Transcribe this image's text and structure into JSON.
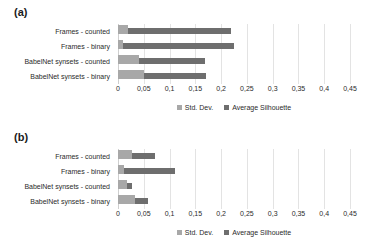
{
  "figure": {
    "panels": [
      {
        "label": "(a)"
      },
      {
        "label": "(b)"
      }
    ]
  },
  "legend": {
    "items": [
      {
        "name": "Std. Dev.",
        "color": "#a8a8a8"
      },
      {
        "name": "Average Silhouette",
        "color": "#6e6e6e"
      }
    ]
  },
  "axis": {
    "ticks": [
      "0",
      "0,05",
      "0,1",
      "0,15",
      "0,2",
      "0,25",
      "0,3",
      "0,35",
      "0,4",
      "0,45"
    ]
  },
  "chart_data": [
    {
      "type": "bar",
      "title": "(a)",
      "orientation": "horizontal",
      "categories": [
        "Frames - counted",
        "Frames - binary",
        "BabelNet synsets - counted",
        "BabelNet synsets - binary"
      ],
      "series": [
        {
          "name": "Std. Dev.",
          "values": [
            0.02,
            0.01,
            0.04,
            0.05
          ],
          "color": "#a8a8a8"
        },
        {
          "name": "Average Silhouette",
          "values": [
            0.22,
            0.225,
            0.168,
            0.17
          ],
          "color": "#6e6e6e"
        }
      ],
      "xlabel": "",
      "ylabel": "",
      "xlim": [
        0,
        0.45
      ],
      "xticks": [
        0,
        0.05,
        0.1,
        0.15,
        0.2,
        0.25,
        0.3,
        0.35,
        0.4,
        0.45
      ],
      "xtick_labels": [
        "0",
        "0,05",
        "0,1",
        "0,15",
        "0,2",
        "0,25",
        "0,3",
        "0,35",
        "0,4",
        "0,45"
      ],
      "grid": "vertical",
      "legend_position": "bottom"
    },
    {
      "type": "bar",
      "title": "(b)",
      "orientation": "horizontal",
      "categories": [
        "Frames - counted",
        "Frames - binary",
        "BabelNet synsets - counted",
        "BabelNet synsets - binary"
      ],
      "series": [
        {
          "name": "Std. Dev.",
          "values": [
            0.027,
            0.012,
            0.018,
            0.033
          ],
          "color": "#a8a8a8"
        },
        {
          "name": "Average Silhouette",
          "values": [
            0.071,
            0.11,
            0.027,
            0.058
          ],
          "color": "#6e6e6e"
        }
      ],
      "xlabel": "",
      "ylabel": "",
      "xlim": [
        0,
        0.45
      ],
      "xticks": [
        0,
        0.05,
        0.1,
        0.15,
        0.2,
        0.25,
        0.3,
        0.35,
        0.4,
        0.45
      ],
      "xtick_labels": [
        "0",
        "0,05",
        "0,1",
        "0,15",
        "0,2",
        "0,25",
        "0,3",
        "0,35",
        "0,4",
        "0,45"
      ],
      "grid": "vertical",
      "legend_position": "bottom"
    }
  ]
}
